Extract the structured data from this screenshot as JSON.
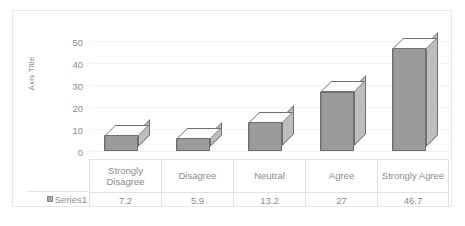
{
  "chart_data": {
    "type": "bar",
    "title": "",
    "subtitle": "",
    "xlabel": "",
    "ylabel": "Axis Title",
    "ylim": [
      0,
      50
    ],
    "ytick_labels": [
      "50",
      "40",
      "30",
      "20",
      "10",
      "0"
    ],
    "yticks": [
      50,
      40,
      30,
      20,
      10,
      0
    ],
    "grid": true,
    "legend_position": "data-table-row",
    "three_d": true,
    "categories": [
      "Strongly Disagree",
      "Disagree",
      "Neutral",
      "Agree",
      "Strongly Agree"
    ],
    "series": [
      {
        "name": "Series1",
        "values": [
          7.2,
          5.9,
          13.2,
          27,
          46.7
        ],
        "value_labels": [
          "7.2",
          "5.9",
          "13.2",
          "27",
          "46.7"
        ],
        "color": "#9b9b9b"
      }
    ],
    "data_table": {
      "visible": true,
      "legend_key_label": "Series1",
      "header_cells": [
        "Strongly Disagree",
        "Disagree",
        "Neutral",
        "Agree",
        "Strongly Agree"
      ],
      "value_cells": [
        "7.2",
        "5.9",
        "13.2",
        "27",
        "46.7"
      ]
    },
    "colors": {
      "bar_front": "#9b9b9b",
      "bar_side": "#bdbdbd",
      "bar_top": "#fdfdfd",
      "bar_outline": "#6f6f6f",
      "gridline": "#f4f4f4",
      "text": "#8c8c8c",
      "border": "#e8e8e8",
      "table_border": "#e2e2e2",
      "plot_background": "#ffffff"
    }
  }
}
